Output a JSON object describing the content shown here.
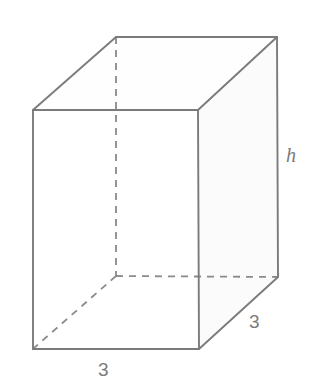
{
  "figure": {
    "shape_name": "rectangular-prism",
    "colors": {
      "stroke": "#7b7b7b",
      "dashed_stroke": "#8a8a8a",
      "side_face_fill": "#fbfbfb",
      "background": "#ffffff",
      "label_color": "#7b7b7b"
    },
    "stroke_width": 1.8,
    "dash_pattern": "7 6"
  },
  "labels": {
    "width": "3",
    "depth": "3",
    "height": "h"
  },
  "geometry": {
    "front_face": {
      "top_left": [
        33,
        110
      ],
      "top_right": [
        198,
        110
      ],
      "bottom_right": [
        199,
        349
      ],
      "bottom_left": [
        33,
        349
      ]
    },
    "back_offset": [
      80,
      -73
    ],
    "vertices": {
      "front_top_left": [
        33,
        110
      ],
      "front_top_right": [
        198,
        110
      ],
      "front_bottom_left": [
        33,
        349
      ],
      "front_bottom_right": [
        199,
        349
      ],
      "back_top_left": [
        116,
        37
      ],
      "back_top_right": [
        277,
        37
      ],
      "back_bottom_left": [
        116,
        276
      ],
      "back_bottom_right": [
        278,
        277
      ]
    },
    "hidden_edges": [
      "back_top_left-to-back_bottom_left",
      "back_bottom_left-to-front_bottom_left",
      "back_bottom_left-to-back_bottom_right"
    ]
  },
  "dimensions": {
    "base_width": 3,
    "base_depth": 3,
    "height_variable": "h"
  }
}
